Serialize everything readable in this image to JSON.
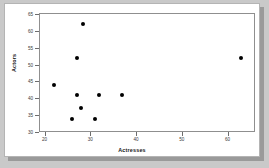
{
  "chart_data": {
    "type": "scatter",
    "title": "",
    "xlabel": "Actresses",
    "ylabel": "Actors",
    "xlim": [
      19,
      66
    ],
    "ylim": [
      30,
      65
    ],
    "xticks": [
      20,
      30,
      40,
      50,
      60
    ],
    "yticks": [
      30,
      35,
      40,
      45,
      50,
      55,
      60,
      65
    ],
    "grid": false,
    "legend": false,
    "marker": "filled-circle",
    "marker_color": "#000000",
    "points": [
      {
        "x": 22,
        "y": 44
      },
      {
        "x": 26,
        "y": 34
      },
      {
        "x": 27,
        "y": 41
      },
      {
        "x": 27,
        "y": 52
      },
      {
        "x": 28,
        "y": 37
      },
      {
        "x": 28.5,
        "y": 62
      },
      {
        "x": 31,
        "y": 34
      },
      {
        "x": 32,
        "y": 41
      },
      {
        "x": 37,
        "y": 41
      },
      {
        "x": 63,
        "y": 52
      }
    ]
  }
}
